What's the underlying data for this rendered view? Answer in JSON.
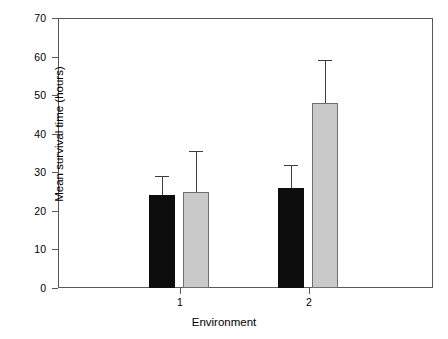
{
  "chart_data": {
    "type": "bar",
    "title": "",
    "xlabel": "Environment",
    "ylabel": "Mean survival time (hours)",
    "categories": [
      "1",
      "2"
    ],
    "ylim": [
      0,
      70
    ],
    "yticks": [
      0,
      10,
      20,
      30,
      40,
      50,
      60,
      70
    ],
    "ytick_labels": [
      "0",
      "10",
      "20",
      "30",
      "40",
      "50",
      "60",
      "70"
    ],
    "grid": false,
    "legend": "none",
    "error_bars": "upper only",
    "series": [
      {
        "name": "dark",
        "color": "#0d0d0d",
        "values": [
          24,
          26
        ],
        "error_upper": [
          5,
          6
        ],
        "error_top_values": [
          29,
          32
        ]
      },
      {
        "name": "light",
        "color": "#c9c9c9",
        "values": [
          24.8,
          48
        ],
        "error_upper": [
          10.7,
          11
        ],
        "error_top_values": [
          35.5,
          59
        ]
      }
    ]
  },
  "axes": {
    "y_label": "Mean survival time (hours)",
    "x_label": "Environment",
    "y_ticks": [
      "70",
      "60",
      "50",
      "40",
      "30",
      "20",
      "10",
      "0"
    ],
    "x_ticks": [
      "1",
      "2"
    ]
  },
  "colors": {
    "dark_bar": "#0d0d0d",
    "light_bar": "#c9c9c9",
    "axis": "#58595b",
    "background": "#ffffff"
  }
}
